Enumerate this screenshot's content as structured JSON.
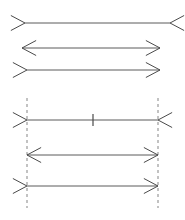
{
  "figure": {
    "background_color": "#ffffff",
    "line_color": "#5a5a5a",
    "fin_color": "#4a4a4a",
    "guide_color": "#9a9a9a",
    "width": 185,
    "height": 220
  },
  "chart_data": {
    "type": "diagram",
    "xlabel": "",
    "ylabel": "",
    "grid": false,
    "legend": "none",
    "panels": [
      {
        "name": "upper-panel",
        "has_guides": false,
        "has_center_tick": false,
        "lines": [
          {
            "name": "upper-line-1",
            "y": 23,
            "x1": 25,
            "x2": 170,
            "length": 145,
            "left_fin": "outward",
            "right_fin": "outward",
            "fin_length": 16,
            "fin_angle_deg": 28
          },
          {
            "name": "upper-line-2",
            "y": 48,
            "x1": 22,
            "x2": 160,
            "length": 138,
            "left_fin": "inward",
            "right_fin": "inward",
            "fin_length": 16,
            "fin_angle_deg": 28
          },
          {
            "name": "upper-line-3",
            "y": 70,
            "x1": 27,
            "x2": 160,
            "length": 133,
            "left_fin": "outward",
            "right_fin": "inward",
            "fin_length": 16,
            "fin_angle_deg": 28
          }
        ]
      },
      {
        "name": "lower-panel",
        "has_guides": true,
        "has_center_tick": true,
        "guides": [
          {
            "name": "guide-left",
            "x": 27,
            "y1": 98,
            "y2": 208
          },
          {
            "name": "guide-right",
            "x": 158,
            "y1": 98,
            "y2": 208
          }
        ],
        "center_tick": {
          "name": "center-tick",
          "x": 93,
          "y": 120,
          "half_height": 6
        },
        "lines": [
          {
            "name": "lower-line-1",
            "y": 120,
            "x1": 27,
            "x2": 158,
            "length": 131,
            "left_fin": "outward",
            "right_fin": "outward",
            "fin_length": 16,
            "fin_angle_deg": 28
          },
          {
            "name": "lower-line-2",
            "y": 155,
            "x1": 27,
            "x2": 158,
            "length": 131,
            "left_fin": "inward",
            "right_fin": "inward",
            "fin_length": 16,
            "fin_angle_deg": 28
          },
          {
            "name": "lower-line-3",
            "y": 186,
            "x1": 27,
            "x2": 158,
            "length": 131,
            "left_fin": "outward",
            "right_fin": "inward",
            "fin_length": 16,
            "fin_angle_deg": 28
          }
        ]
      }
    ]
  }
}
